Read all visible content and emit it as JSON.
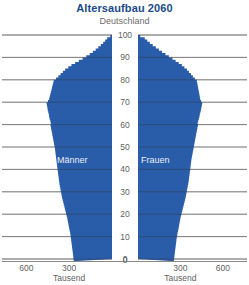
{
  "chart_data": {
    "type": "bar",
    "orientation": "horizontal",
    "subtype": "population-pyramid",
    "title": "Altersaufbau 2060",
    "subtitle": "Deutschland",
    "xlabel": "Tausend",
    "ylabel": "",
    "grid": true,
    "legend_position": "inside-bars",
    "colors": {
      "bars": "#2a5da9",
      "title": "#1b4a8a",
      "axis_text": "#5f5f5f",
      "gridline": "#8a8a8a",
      "inside_label": "#e8eef6",
      "background": "#ffffff"
    },
    "axis": {
      "age_label": "",
      "age_min": 0,
      "age_max": 100,
      "age_ticks": [
        0,
        10,
        20,
        30,
        40,
        50,
        60,
        70,
        80,
        90,
        100
      ],
      "value_unit": "Tausend",
      "value_max": 700,
      "value_ticks_left": [
        600,
        300
      ],
      "value_ticks_right": [
        300,
        600
      ],
      "center_tick": "0",
      "value_tick_labels": [
        "600",
        "300",
        "0",
        "300",
        "600"
      ]
    },
    "series": [
      {
        "name": "Männer",
        "side": "left",
        "label": "Männer",
        "categories": [
          0,
          1,
          2,
          3,
          4,
          5,
          6,
          7,
          8,
          9,
          10,
          11,
          12,
          13,
          14,
          15,
          16,
          17,
          18,
          19,
          20,
          21,
          22,
          23,
          24,
          25,
          26,
          27,
          28,
          29,
          30,
          31,
          32,
          33,
          34,
          35,
          36,
          37,
          38,
          39,
          40,
          41,
          42,
          43,
          44,
          45,
          46,
          47,
          48,
          49,
          50,
          51,
          52,
          53,
          54,
          55,
          56,
          57,
          58,
          59,
          60,
          61,
          62,
          63,
          64,
          65,
          66,
          67,
          68,
          69,
          70,
          71,
          72,
          73,
          74,
          75,
          76,
          77,
          78,
          79,
          80,
          81,
          82,
          83,
          84,
          85,
          86,
          87,
          88,
          89,
          90,
          91,
          92,
          93,
          94,
          95,
          96,
          97,
          98,
          99,
          100
        ],
        "values": [
          268,
          270,
          272,
          274,
          276,
          278,
          280,
          282,
          284,
          286,
          288,
          290,
          293,
          296,
          299,
          302,
          305,
          308,
          311,
          314,
          318,
          322,
          326,
          330,
          334,
          338,
          342,
          346,
          350,
          353,
          356,
          359,
          362,
          365,
          368,
          370,
          372,
          374,
          376,
          378,
          380,
          382,
          384,
          386,
          388,
          390,
          392,
          394,
          396,
          398,
          400,
          403,
          406,
          409,
          412,
          415,
          418,
          421,
          424,
          427,
          430,
          428,
          432,
          436,
          440,
          442,
          446,
          450,
          452,
          455,
          458,
          448,
          440,
          436,
          432,
          428,
          424,
          420,
          416,
          412,
          408,
          392,
          376,
          360,
          344,
          328,
          306,
          284,
          258,
          232,
          206,
          180,
          156,
          134,
          114,
          96,
          78,
          62,
          48,
          34,
          12
        ]
      },
      {
        "name": "Frauen",
        "side": "right",
        "label": "Frauen",
        "categories": [
          0,
          1,
          2,
          3,
          4,
          5,
          6,
          7,
          8,
          9,
          10,
          11,
          12,
          13,
          14,
          15,
          16,
          17,
          18,
          19,
          20,
          21,
          22,
          23,
          24,
          25,
          26,
          27,
          28,
          29,
          30,
          31,
          32,
          33,
          34,
          35,
          36,
          37,
          38,
          39,
          40,
          41,
          42,
          43,
          44,
          45,
          46,
          47,
          48,
          49,
          50,
          51,
          52,
          53,
          54,
          55,
          56,
          57,
          58,
          59,
          60,
          61,
          62,
          63,
          64,
          65,
          66,
          67,
          68,
          69,
          70,
          71,
          72,
          73,
          74,
          75,
          76,
          77,
          78,
          79,
          80,
          81,
          82,
          83,
          84,
          85,
          86,
          87,
          88,
          89,
          90,
          91,
          92,
          93,
          94,
          95,
          96,
          97,
          98,
          99,
          100
        ],
        "values": [
          254,
          256,
          258,
          260,
          262,
          264,
          266,
          268,
          270,
          272,
          274,
          277,
          280,
          283,
          286,
          289,
          292,
          295,
          298,
          301,
          305,
          309,
          313,
          317,
          321,
          325,
          329,
          333,
          337,
          340,
          343,
          346,
          349,
          352,
          355,
          358,
          360,
          362,
          364,
          366,
          368,
          370,
          372,
          374,
          376,
          378,
          381,
          384,
          387,
          390,
          393,
          396,
          399,
          402,
          405,
          408,
          411,
          414,
          417,
          420,
          424,
          422,
          426,
          430,
          434,
          437,
          441,
          445,
          448,
          451,
          454,
          446,
          440,
          437,
          434,
          431,
          428,
          425,
          422,
          419,
          416,
          402,
          388,
          374,
          360,
          346,
          328,
          310,
          288,
          266,
          244,
          218,
          194,
          170,
          148,
          126,
          104,
          84,
          66,
          48,
          16
        ]
      }
    ]
  },
  "series_labels": {
    "maenner": "Männer",
    "frauen": "Frauen"
  },
  "unit_left": "Tausend",
  "unit_right": "Tausend"
}
